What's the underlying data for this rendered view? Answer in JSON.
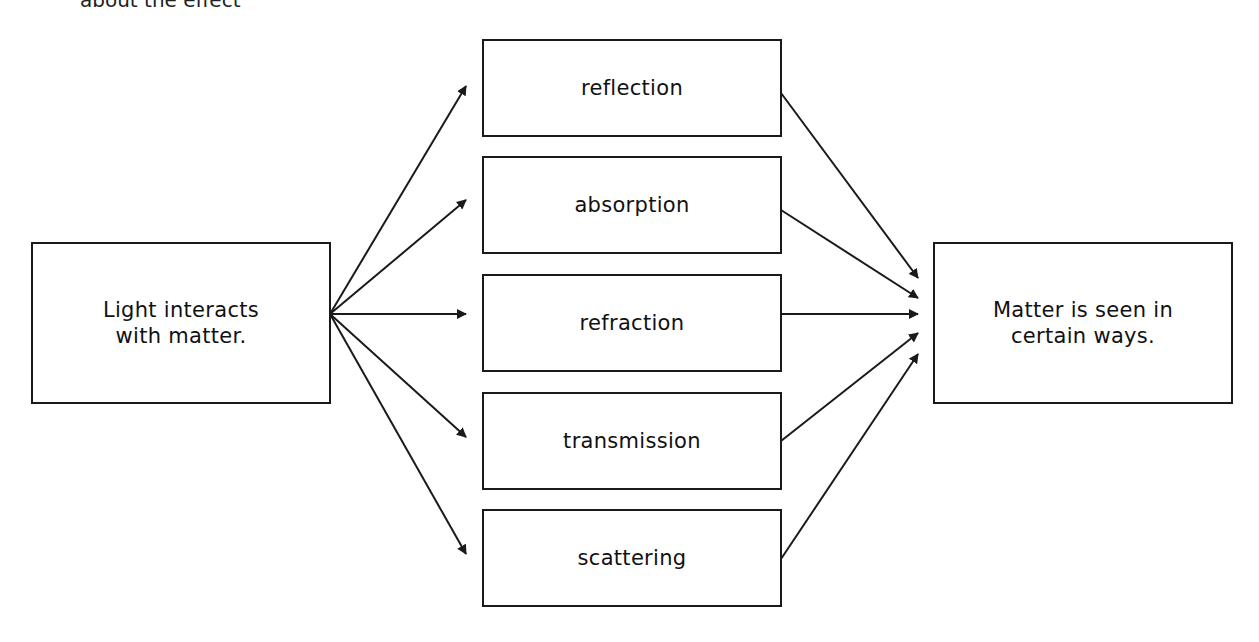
{
  "caption_partial": "about the effect",
  "source_box": {
    "label": "Light interacts\nwith matter."
  },
  "interactions": [
    {
      "label": "reflection"
    },
    {
      "label": "absorption"
    },
    {
      "label": "refraction"
    },
    {
      "label": "transmission"
    },
    {
      "label": "scattering"
    }
  ],
  "result_box": {
    "label": "Matter is seen in\ncertain ways."
  },
  "colors": {
    "stroke": "#1a1a1a",
    "background": "#ffffff"
  }
}
